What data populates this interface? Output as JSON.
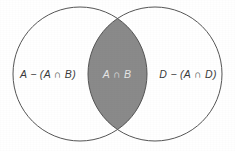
{
  "figure": {
    "type": "venn-diagram",
    "background_color": "#ffffff",
    "outline_color": "#555555",
    "outline_width": 1,
    "circle_fill": "#ffffff",
    "intersection_fill": "#8a8a8a",
    "width": 235,
    "height": 151,
    "circles": [
      {
        "id": "left",
        "name": "set-a-circle",
        "cx": 80,
        "cy": 74,
        "r": 67
      },
      {
        "id": "right",
        "name": "set-b-circle",
        "cx": 155,
        "cy": 74,
        "r": 67
      }
    ],
    "regions": [
      {
        "id": "left-only",
        "label": "A − (A ∩ B)",
        "label_x": 48,
        "label_y": 74,
        "text_color": "#3b3b3b",
        "fill": "#ffffff"
      },
      {
        "id": "intersection",
        "label": "A ∩ B",
        "label_x": 117,
        "label_y": 74,
        "text_color": "#e6e6e6",
        "fill": "#8a8a8a"
      },
      {
        "id": "right-only",
        "label": "D − (A ∩ D)",
        "label_x": 188,
        "label_y": 74,
        "text_color": "#3b3b3b",
        "fill": "#ffffff"
      }
    ]
  }
}
